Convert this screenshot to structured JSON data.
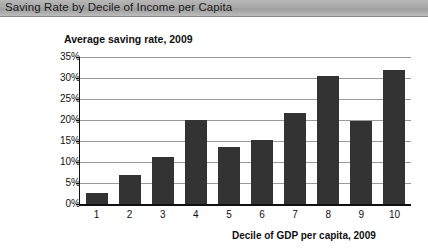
{
  "header": {
    "title": "Saving Rate by Decile of Income per Capita"
  },
  "chart_data": {
    "type": "bar",
    "title": "Saving Rate by Decile of Income per Capita",
    "ylabel": "Average saving rate, 2009",
    "xlabel": "Decile of GDP per capita, 2009",
    "categories": [
      "1",
      "2",
      "3",
      "4",
      "5",
      "6",
      "7",
      "8",
      "9",
      "10"
    ],
    "values": [
      2.6,
      7.0,
      11.3,
      20.0,
      13.6,
      15.3,
      21.6,
      30.5,
      19.7,
      31.8
    ],
    "ylim": [
      0,
      35
    ],
    "ytick_labels": [
      "0%",
      "5%",
      "10%",
      "15%",
      "20%",
      "25%",
      "30%",
      "35%"
    ],
    "ytick_values": [
      0,
      5,
      10,
      15,
      20,
      25,
      30,
      35
    ],
    "grid": true,
    "legend": "none",
    "bar_color": "#333333",
    "gridline_color": "#9a9a9a",
    "axis_color": "#111111"
  }
}
